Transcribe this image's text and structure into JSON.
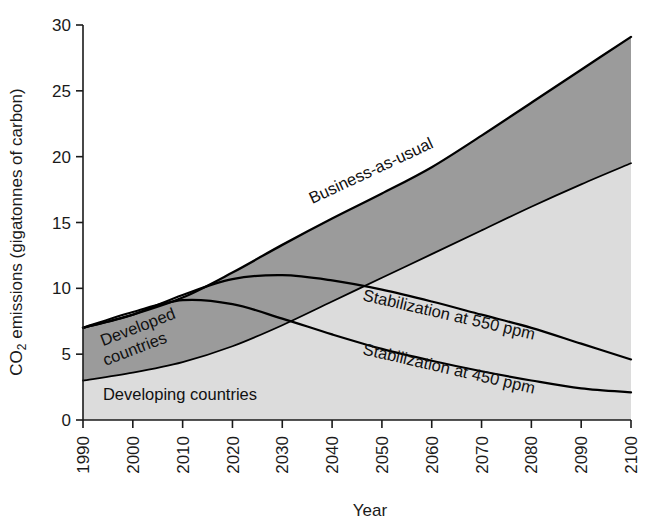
{
  "chart_data": {
    "type": "area",
    "title": "",
    "xlabel": "Year",
    "ylabel": "CO2 emissions (gigatonnes of carbon)",
    "ylabel_main": "CO",
    "ylabel_sub": "2",
    "ylabel_rest": " emissions (gigatonnes of carbon)",
    "grid": false,
    "legend_position": "inline-annotations",
    "xlim": [
      1990,
      2100
    ],
    "ylim": [
      0,
      30
    ],
    "x_ticks": [
      1990,
      2000,
      2010,
      2020,
      2030,
      2040,
      2050,
      2060,
      2070,
      2080,
      2090,
      2100
    ],
    "x_tick_labels": [
      "1990",
      "2000",
      "2010",
      "2020",
      "2030",
      "2040",
      "2050",
      "2060",
      "2070",
      "2080",
      "2090",
      "2100"
    ],
    "y_ticks": [
      0,
      5,
      10,
      15,
      20,
      25,
      30
    ],
    "y_tick_labels": [
      "0",
      "5",
      "10",
      "15",
      "20",
      "25",
      "30"
    ],
    "x": [
      1990,
      2000,
      2010,
      2020,
      2030,
      2040,
      2050,
      2060,
      2070,
      2080,
      2090,
      2100
    ],
    "series": [
      {
        "name": "Business-as-usual",
        "role": "total-upper-boundary",
        "color": "#000000",
        "values": [
          7.0,
          8.0,
          9.3,
          11.2,
          13.3,
          15.3,
          17.2,
          19.2,
          21.6,
          24.1,
          26.6,
          29.1
        ]
      },
      {
        "name": "Developing countries",
        "role": "lower-band-upper-boundary",
        "color": "#000000",
        "values": [
          3.0,
          3.6,
          4.4,
          5.6,
          7.2,
          9.0,
          10.8,
          12.6,
          14.4,
          16.2,
          17.9,
          19.5
        ]
      },
      {
        "name": "Stabilization at 550 ppm",
        "role": "scenario-line",
        "color": "#000000",
        "values": [
          7.0,
          8.0,
          9.5,
          10.7,
          11.0,
          10.6,
          9.9,
          9.0,
          8.0,
          7.0,
          5.8,
          4.6
        ]
      },
      {
        "name": "Stabilization at 450 ppm",
        "role": "scenario-line",
        "color": "#000000",
        "values": [
          7.0,
          8.2,
          9.1,
          8.8,
          7.7,
          6.5,
          5.4,
          4.5,
          3.7,
          3.0,
          2.4,
          2.1
        ]
      }
    ],
    "bands": [
      {
        "name": "Developed countries",
        "fill": "#9b9b9b",
        "description": "dark grey band between developing-countries boundary and business-as-usual total"
      },
      {
        "name": "Developing countries",
        "fill": "#dcdcdc",
        "description": "light grey band from zero to developing-countries boundary"
      }
    ],
    "annotations": [
      {
        "id": "bau",
        "text": "Business-as-usual",
        "x": 2036,
        "y": 16.4,
        "rotation": -25
      },
      {
        "id": "developed",
        "text": "Developed",
        "x": 1994,
        "y": 5.6,
        "rotation": -21
      },
      {
        "id": "countries",
        "text": "countries",
        "x": 1994.5,
        "y": 4.1,
        "rotation": -21
      },
      {
        "id": "developing",
        "text": "Developing countries",
        "x": 1994,
        "y": 1.5,
        "rotation": 0
      },
      {
        "id": "stab550",
        "text": "Stabilization at 550 ppm",
        "x": 2046,
        "y": 9.1,
        "rotation": 13
      },
      {
        "id": "stab450",
        "text": "Stabilization at 450 ppm",
        "x": 2046,
        "y": 5.0,
        "rotation": 13
      }
    ],
    "colors": {
      "developed_band": "#9b9b9b",
      "developing_band": "#dcdcdc",
      "line": "#000000",
      "axis": "#1a1a1a",
      "background": "#ffffff"
    }
  },
  "axes": {
    "x_axis_title": "Year",
    "y_axis_title_prefix": "CO",
    "y_axis_title_subscript": "2",
    "y_axis_title_suffix": " emissions (gigatonnes of carbon)"
  }
}
